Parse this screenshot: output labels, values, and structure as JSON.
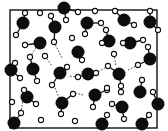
{
  "diagram": {
    "colors": {
      "oxygen": "#0d0d0d",
      "hydrogen_fill": "#ffffff",
      "line": "#111111",
      "background": "#ffffff"
    },
    "frame": {
      "x": 10,
      "y": 10,
      "width": 147,
      "height": 118
    },
    "molecules": [
      {
        "o": [
          23,
          23
        ],
        "h": [
          [
            25,
            13
          ],
          [
            16,
            35
          ]
        ]
      },
      {
        "o": [
          64,
          8
        ],
        "h": [
          [
            66,
            20
          ],
          [
            78,
            12
          ]
        ]
      },
      {
        "o": [
          55,
          27
        ],
        "h": [
          [
            51,
            16
          ],
          [
            54,
            42
          ]
        ]
      },
      {
        "o": [
          40,
          43
        ],
        "h": [
          [
            25,
            45
          ]
        ]
      },
      {
        "o": [
          87,
          23
        ],
        "h": [
          [
            101,
            23
          ],
          [
            85,
            34
          ]
        ]
      },
      {
        "o": [
          124,
          20
        ],
        "h": [
          [
            115,
            11
          ],
          [
            134,
            25
          ]
        ]
      },
      {
        "o": [
          150,
          22
        ],
        "h": [
          [
            150,
            11
          ],
          [
            158,
            30
          ]
        ]
      },
      {
        "o": [
          109,
          41
        ],
        "h": [
          [
            102,
            43
          ],
          [
            106,
            30
          ]
        ]
      },
      {
        "o": [
          130,
          43
        ],
        "h": [
          [
            123,
            43
          ],
          [
            143,
            40
          ]
        ]
      },
      {
        "o": [
          11,
          70
        ],
        "h": [
          [
            15,
            63
          ],
          [
            20,
            78
          ]
        ]
      },
      {
        "o": [
          33,
          69
        ],
        "h": [
          [
            30,
            57
          ],
          [
            37,
            81
          ]
        ]
      },
      {
        "o": [
          60,
          73
        ],
        "h": [
          [
            52,
            85
          ],
          [
            67,
            67
          ]
        ]
      },
      {
        "o": [
          78,
          52
        ],
        "h": [
          [
            82,
            60
          ]
        ]
      },
      {
        "o": [
          88,
          74
        ],
        "h": [
          [
            96,
            73
          ],
          [
            78,
            77
          ]
        ]
      },
      {
        "o": [
          119,
          74
        ],
        "h": [
          [
            108,
            66
          ],
          [
            121,
            86
          ]
        ]
      },
      {
        "o": [
          150,
          59
        ],
        "h": [
          [
            138,
            65
          ],
          [
            148,
            47
          ]
        ]
      },
      {
        "o": [
          27,
          97
        ],
        "h": [
          [
            24,
            90
          ],
          [
            36,
            104
          ]
        ]
      },
      {
        "o": [
          14,
          123
        ],
        "h": [
          [
            21,
            113
          ]
        ]
      },
      {
        "o": [
          62,
          103
        ],
        "h": [
          [
            73,
            94
          ],
          [
            61,
            114
          ]
        ]
      },
      {
        "o": [
          95,
          95
        ],
        "h": [
          [
            107,
            90
          ],
          [
            93,
            107
          ]
        ]
      },
      {
        "o": [
          122,
          107
        ],
        "h": [
          [
            112,
            104
          ],
          [
            124,
            119
          ]
        ]
      },
      {
        "o": [
          140,
          92
        ],
        "h": [
          [
            142,
            80
          ]
        ]
      },
      {
        "o": [
          102,
          124
        ],
        "h": [
          [
            107,
            115
          ]
        ]
      },
      {
        "o": [
          142,
          124
        ],
        "h": [
          [
            149,
            115
          ]
        ]
      },
      {
        "o": [
          158,
          104
        ],
        "h": [
          [
            153,
            92
          ]
        ]
      }
    ],
    "lone_hydrogens": [
      [
        40,
        13
      ],
      [
        95,
        11
      ],
      [
        45,
        56
      ],
      [
        12,
        102
      ],
      [
        41,
        120
      ],
      [
        75,
        121
      ],
      [
        114,
        54
      ],
      [
        107,
        88
      ],
      [
        72,
        38
      ],
      [
        121,
        92
      ]
    ],
    "hydrogen_bonds": [
      [
        [
          54,
          42
        ],
        [
          62,
          58
        ]
      ],
      [
        [
          45,
          56
        ],
        [
          52,
          66
        ]
      ],
      [
        [
          106,
          30
        ],
        [
          100,
          20
        ]
      ],
      [
        [
          114,
          54
        ],
        [
          116,
          66
        ]
      ],
      [
        [
          108,
          66
        ],
        [
          96,
          73
        ]
      ],
      [
        [
          138,
          65
        ],
        [
          128,
          70
        ]
      ],
      [
        [
          21,
          113
        ],
        [
          24,
          92
        ]
      ],
      [
        [
          55,
          88
        ],
        [
          60,
          100
        ]
      ],
      [
        [
          83,
          95
        ],
        [
          75,
          93
        ]
      ],
      [
        [
          121,
          92
        ],
        [
          120,
          86
        ]
      ],
      [
        [
          30,
          57
        ],
        [
          37,
          46
        ]
      ],
      [
        [
          78,
          77
        ],
        [
          68,
          76
        ]
      ]
    ]
  }
}
